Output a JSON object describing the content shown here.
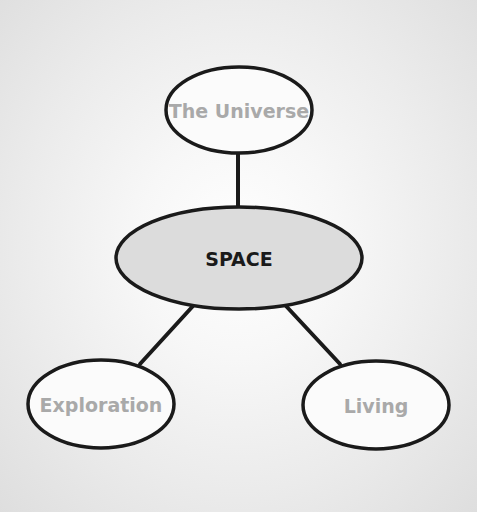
{
  "diagram": {
    "type": "concept-map",
    "colors": {
      "background_center": "#ffffff",
      "background_edge": "#dedede",
      "stroke": "#1a1a1a",
      "center_fill": "#dcdcdc",
      "leaf_fill": "#fbfbfb",
      "center_text": "#1a1a1a",
      "leaf_text": "#a9a9a9"
    },
    "center": {
      "label": "SPACE"
    },
    "nodes": [
      {
        "id": "universe",
        "label": "The Universe"
      },
      {
        "id": "exploration",
        "label": "Exploration"
      },
      {
        "id": "living",
        "label": "Living"
      }
    ],
    "edges": [
      {
        "from": "SPACE",
        "to": "The Universe"
      },
      {
        "from": "SPACE",
        "to": "Exploration"
      },
      {
        "from": "SPACE",
        "to": "Living"
      }
    ]
  }
}
